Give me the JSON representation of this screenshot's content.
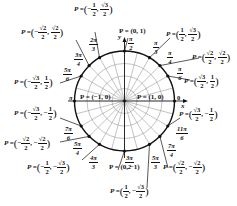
{
  "diagram": {
    "title": "",
    "type": "unit-circle",
    "axes": {
      "x_label": "x",
      "y_label": "y"
    },
    "center_point": {
      "left_label": "P = (−1, 0)",
      "right_label": "P = (1, 0)"
    },
    "angles": [
      {
        "id": "0",
        "num": "0",
        "den": "",
        "label": "0",
        "point": "P = (1, 0)"
      },
      {
        "id": "pi6",
        "num": "π",
        "den": "6",
        "label": "π/6",
        "point_x": "√3/2",
        "point_y": "1/2"
      },
      {
        "id": "pi4",
        "num": "π",
        "den": "4",
        "label": "π/4",
        "point_x": "√2/2",
        "point_y": "√2/2"
      },
      {
        "id": "pi3",
        "num": "π",
        "den": "3",
        "label": "π/3",
        "point_x": "1/2",
        "point_y": "√3/2"
      },
      {
        "id": "pi2",
        "num": "π",
        "den": "2",
        "label": "π/2",
        "point": "P = (0, 1)"
      },
      {
        "id": "2pi3",
        "num": "2π",
        "den": "3",
        "label": "2π/3",
        "point_x": "−1/2",
        "point_y": "√3/2"
      },
      {
        "id": "3pi4",
        "num": "3π",
        "den": "4",
        "label": "3π/4",
        "point_x": "−√2/2",
        "point_y": "√2/2"
      },
      {
        "id": "5pi6",
        "num": "5π",
        "den": "6",
        "label": "5π/6",
        "point_x": "−√3/2",
        "point_y": "1/2"
      },
      {
        "id": "pi",
        "num": "π",
        "den": "",
        "label": "π",
        "point": "P = (−1, 0)"
      },
      {
        "id": "7pi6",
        "num": "7π",
        "den": "6",
        "label": "7π/6",
        "point_x": "−√3/2",
        "point_y": "−1/2"
      },
      {
        "id": "5pi4",
        "num": "5π",
        "den": "4",
        "label": "5π/4",
        "point_x": "−√2/2",
        "point_y": "−√2/2"
      },
      {
        "id": "4pi3",
        "num": "4π",
        "den": "3",
        "label": "4π/3",
        "point_x": "−1/2",
        "point_y": "−√3/2"
      },
      {
        "id": "3pi2",
        "num": "3π",
        "den": "2",
        "label": "3π/2",
        "point": "P = (0, −1)"
      },
      {
        "id": "5pi3",
        "num": "5π",
        "den": "3",
        "label": "5π/3",
        "point_x": "1/2",
        "point_y": "−√3/2"
      },
      {
        "id": "7pi4",
        "num": "7π",
        "den": "4",
        "label": "7π/4",
        "point_x": "√2/2",
        "point_y": "−√2/2"
      },
      {
        "id": "11pi6",
        "num": "11π",
        "den": "6",
        "label": "11π/6",
        "point_x": "√3/2",
        "point_y": "−1/2"
      }
    ],
    "text": {
      "P_eq": "P =",
      "pi": "π",
      "zero": "0",
      "pt_0_1": "P = (0, 1)",
      "pt_0_m1": "P = (0, −1)",
      "pt_m1_0": "P = (−1, 0)",
      "pt_1_0": "P = (1, 0)",
      "one": "1",
      "two": "2",
      "sqrt2": "√2",
      "sqrt3": "√3",
      "neg_one": "−1",
      "neg_sqrt2": "−√2",
      "neg_sqrt3": "−√3",
      "neg": "−",
      "comma": ",",
      "lp": "(",
      "rp": ")",
      "n_pi": "π",
      "n_2pi": "2π",
      "n_3pi": "3π",
      "n_4pi": "4π",
      "n_5pi": "5π",
      "n_7pi": "7π",
      "n_11pi": "11π",
      "d2": "2",
      "d3": "3",
      "d4": "4",
      "d6": "6"
    }
  },
  "colors": {
    "ink": "#111111",
    "grid": "#9a9a9a",
    "background": "#ffffff"
  }
}
